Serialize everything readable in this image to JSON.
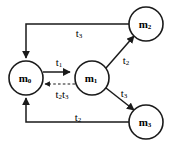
{
  "diagram": {
    "type": "state-transition-diagram",
    "background_color": "#ffffff",
    "stroke_color": "#1a1a1a",
    "width": 175,
    "height": 146,
    "nodes": [
      {
        "id": "m0",
        "base": "m",
        "subscript": "0",
        "label": "m0",
        "cx": 26,
        "cy": 78,
        "r": 17
      },
      {
        "id": "m1",
        "base": "m",
        "subscript": "1",
        "label": "m1",
        "cx": 92,
        "cy": 78,
        "r": 17
      },
      {
        "id": "m2",
        "base": "m",
        "subscript": "2",
        "label": "m2",
        "cx": 146,
        "cy": 24,
        "r": 17
      },
      {
        "id": "m3",
        "base": "m",
        "subscript": "3",
        "label": "m3",
        "cx": 146,
        "cy": 122,
        "r": 17
      }
    ],
    "edges": [
      {
        "id": "e-m0-m1",
        "from": "m0",
        "to": "m1",
        "style": "solid",
        "label_base": "t",
        "label_sub": "1",
        "label": "t1",
        "label_x": 59,
        "label_y": 62
      },
      {
        "id": "e-m1-m0",
        "from": "m1",
        "to": "m0",
        "style": "dashed",
        "label_base": "t",
        "label_sub": "2",
        "label_base2": "t",
        "label_sub2": "3",
        "label": "t2t3",
        "label_x": 62,
        "label_y": 94
      },
      {
        "id": "e-m1-m2",
        "from": "m1",
        "to": "m2",
        "style": "solid",
        "label_base": "t",
        "label_sub": "2",
        "label": "t2",
        "label_x": 126,
        "label_y": 60
      },
      {
        "id": "e-m1-m3",
        "from": "m1",
        "to": "m3",
        "style": "solid",
        "label_base": "t",
        "label_sub": "3",
        "label": "t3",
        "label_x": 124,
        "label_y": 93
      },
      {
        "id": "e-m2-m0",
        "from": "m2",
        "to": "m0",
        "style": "solid",
        "route": "top",
        "label_base": "t",
        "label_sub": "3",
        "label": "t3",
        "label_x": 79,
        "label_y": 33
      },
      {
        "id": "e-m3-m0",
        "from": "m3",
        "to": "m0",
        "style": "solid",
        "route": "bottom",
        "label_base": "t",
        "label_sub": "2",
        "label": "t2",
        "label_x": 78,
        "label_y": 117
      }
    ]
  }
}
